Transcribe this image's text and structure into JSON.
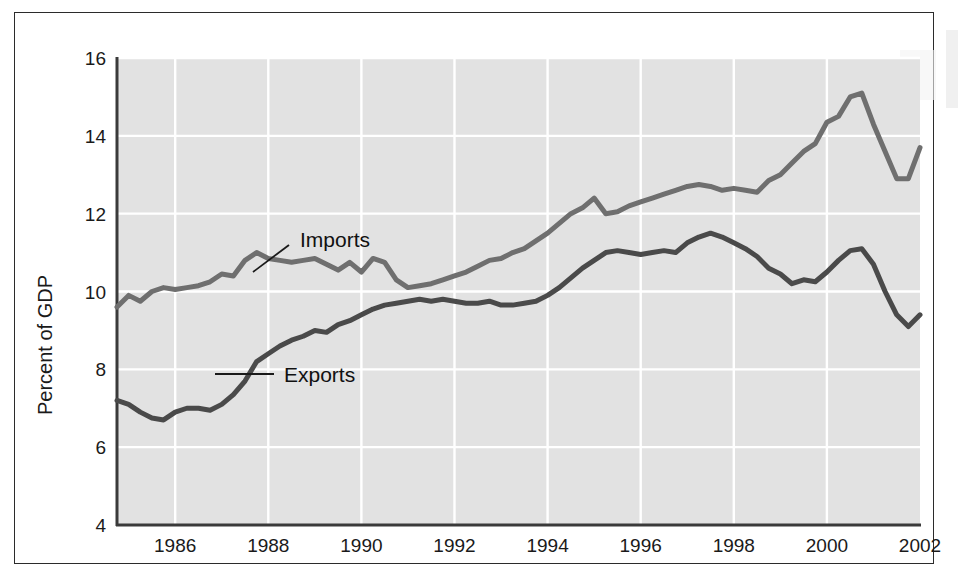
{
  "figure": {
    "background_color": "#ffffff",
    "frame_color": "#2b2b2b",
    "plot_background_color": "#e2e2e2",
    "gridline_color": "#ffffff",
    "axis_color": "#3a3a3a"
  },
  "chart_data": {
    "type": "line",
    "title": "",
    "subtitle": "",
    "xlabel": "",
    "ylabel": "Percent of GDP",
    "xlim": [
      1984.75,
      2002.0
    ],
    "ylim": [
      4,
      16
    ],
    "x_ticks": [
      1986,
      1988,
      1990,
      1992,
      1994,
      1996,
      1998,
      2000,
      2002
    ],
    "x_tick_labels": [
      "1986",
      "1988",
      "1990",
      "1992",
      "1994",
      "1996",
      "1998",
      "2000",
      "2002"
    ],
    "y_ticks": [
      4,
      6,
      8,
      10,
      12,
      14,
      16
    ],
    "y_tick_labels": [
      "4",
      "6",
      "8",
      "10",
      "12",
      "14",
      "16"
    ],
    "grid": true,
    "grid_axis": "both",
    "legend_position": "inline-annotation",
    "series": [
      {
        "name": "Imports",
        "color": "#6f6f6f",
        "line_width": 5,
        "label_annotation": "Imports",
        "x": [
          1984.75,
          1985.0,
          1985.25,
          1985.5,
          1985.75,
          1986.0,
          1986.25,
          1986.5,
          1986.75,
          1987.0,
          1987.25,
          1987.5,
          1987.75,
          1988.0,
          1988.25,
          1988.5,
          1988.75,
          1989.0,
          1989.25,
          1989.5,
          1989.75,
          1990.0,
          1990.25,
          1990.5,
          1990.75,
          1991.0,
          1991.25,
          1991.5,
          1991.75,
          1992.0,
          1992.25,
          1992.5,
          1992.75,
          1993.0,
          1993.25,
          1993.5,
          1993.75,
          1994.0,
          1994.25,
          1994.5,
          1994.75,
          1995.0,
          1995.25,
          1995.5,
          1995.75,
          1996.0,
          1996.25,
          1996.5,
          1996.75,
          1997.0,
          1997.25,
          1997.5,
          1997.75,
          1998.0,
          1998.25,
          1998.5,
          1998.75,
          1999.0,
          1999.25,
          1999.5,
          1999.75,
          2000.0,
          2000.25,
          2000.5,
          2000.75,
          2001.0,
          2001.25,
          2001.5,
          2001.75,
          2002.0
        ],
        "y": [
          9.6,
          9.9,
          9.75,
          10.0,
          10.1,
          10.05,
          10.1,
          10.15,
          10.25,
          10.45,
          10.4,
          10.8,
          11.0,
          10.85,
          10.8,
          10.75,
          10.8,
          10.85,
          10.7,
          10.55,
          10.75,
          10.5,
          10.85,
          10.75,
          10.3,
          10.1,
          10.15,
          10.2,
          10.3,
          10.4,
          10.5,
          10.65,
          10.8,
          10.85,
          11.0,
          11.1,
          11.3,
          11.5,
          11.75,
          12.0,
          12.15,
          12.4,
          12.0,
          12.05,
          12.2,
          12.3,
          12.4,
          12.5,
          12.6,
          12.7,
          12.75,
          12.7,
          12.6,
          12.65,
          12.6,
          12.55,
          12.85,
          13.0,
          13.3,
          13.6,
          13.8,
          14.35,
          14.5,
          15.0,
          15.1,
          14.3,
          13.6,
          12.9,
          12.9,
          13.7
        ]
      },
      {
        "name": "Exports",
        "color": "#4a4a4a",
        "line_width": 5,
        "label_annotation": "Exports",
        "x": [
          1984.75,
          1985.0,
          1985.25,
          1985.5,
          1985.75,
          1986.0,
          1986.25,
          1986.5,
          1986.75,
          1987.0,
          1987.25,
          1987.5,
          1987.75,
          1988.0,
          1988.25,
          1988.5,
          1988.75,
          1989.0,
          1989.25,
          1989.5,
          1989.75,
          1990.0,
          1990.25,
          1990.5,
          1990.75,
          1991.0,
          1991.25,
          1991.5,
          1991.75,
          1992.0,
          1992.25,
          1992.5,
          1992.75,
          1993.0,
          1993.25,
          1993.5,
          1993.75,
          1994.0,
          1994.25,
          1994.5,
          1994.75,
          1995.0,
          1995.25,
          1995.5,
          1995.75,
          1996.0,
          1996.25,
          1996.5,
          1996.75,
          1997.0,
          1997.25,
          1997.5,
          1997.75,
          1998.0,
          1998.25,
          1998.5,
          1998.75,
          1999.0,
          1999.25,
          1999.5,
          1999.75,
          2000.0,
          2000.25,
          2000.5,
          2000.75,
          2001.0,
          2001.25,
          2001.5,
          2001.75,
          2002.0
        ],
        "y": [
          7.2,
          7.1,
          6.9,
          6.75,
          6.7,
          6.9,
          7.0,
          7.0,
          6.95,
          7.1,
          7.35,
          7.7,
          8.2,
          8.4,
          8.6,
          8.75,
          8.85,
          9.0,
          8.95,
          9.15,
          9.25,
          9.4,
          9.55,
          9.65,
          9.7,
          9.75,
          9.8,
          9.75,
          9.8,
          9.75,
          9.7,
          9.7,
          9.75,
          9.65,
          9.65,
          9.7,
          9.75,
          9.9,
          10.1,
          10.35,
          10.6,
          10.8,
          11.0,
          11.05,
          11.0,
          10.95,
          11.0,
          11.05,
          11.0,
          11.25,
          11.4,
          11.5,
          11.4,
          11.25,
          11.1,
          10.9,
          10.6,
          10.45,
          10.2,
          10.3,
          10.25,
          10.5,
          10.8,
          11.05,
          11.1,
          10.7,
          10.0,
          9.4,
          9.1,
          9.4
        ]
      }
    ],
    "annotations": [
      {
        "text": "Imports",
        "text_x": 300,
        "text_y": 247,
        "leader_from_x": 289,
        "leader_from_y": 245,
        "leader_to_x": 253,
        "leader_to_y": 272
      },
      {
        "text": "Exports",
        "text_x": 284,
        "text_y": 382,
        "leader_from_x": 274,
        "leader_from_y": 374,
        "leader_to_x": 215,
        "leader_to_y": 374
      }
    ]
  }
}
